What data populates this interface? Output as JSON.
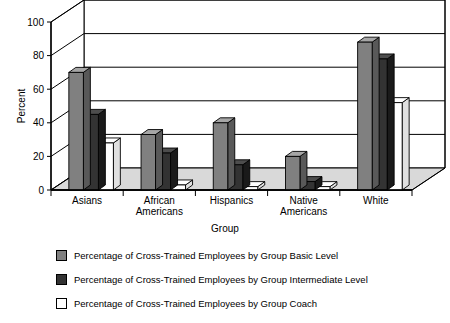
{
  "chart_data": {
    "type": "bar",
    "title": "",
    "xlabel": "Group",
    "ylabel": "Percent",
    "ylim": [
      0,
      100
    ],
    "yticks": [
      0,
      20,
      40,
      60,
      80,
      100
    ],
    "ytick_labels": [
      "0",
      "20",
      "40",
      "60",
      "80",
      "100"
    ],
    "grid": true,
    "grid_axis": "y",
    "legend_position": "below",
    "three_d": true,
    "categories": [
      "Asians",
      "African Americans",
      "Hispanics",
      "Native Americans",
      "White"
    ],
    "category_lines": [
      [
        "Asians"
      ],
      [
        "African",
        "Americans"
      ],
      [
        "Hispanics"
      ],
      [
        "Native",
        "Americans"
      ],
      [
        "White"
      ]
    ],
    "series": [
      {
        "name": "Percentage of Cross-Trained Employees by Group Basic Level",
        "color": "#808080",
        "values": [
          70,
          33,
          40,
          20,
          88
        ]
      },
      {
        "name": "Percentage of Cross-Trained Employees by Group Intermediate Level",
        "color": "#333333",
        "values": [
          45,
          22,
          15,
          5,
          78
        ]
      },
      {
        "name": "Percentage of Cross-Trained Employees by Group Coach",
        "color": "#ffffff",
        "values": [
          28,
          3,
          2,
          2,
          52
        ]
      }
    ]
  },
  "legend": {
    "items": [
      {
        "label": "Percentage of Cross-Trained Employees by Group Basic Level",
        "swatch_name": "legend-swatch-basic",
        "color": "#808080"
      },
      {
        "label": "Percentage of Cross-Trained Employees by Group Intermediate Level",
        "swatch_name": "legend-swatch-intermediate",
        "color": "#333333"
      },
      {
        "label": "Percentage of Cross-Trained Employees by Group Coach",
        "swatch_name": "legend-swatch-coach",
        "color": "#ffffff"
      }
    ]
  },
  "colors": {
    "basic_front": "#808080",
    "basic_top": "#a6a6a6",
    "basic_side": "#595959",
    "intermediate_front": "#333333",
    "intermediate_top": "#4d4d4d",
    "intermediate_side": "#1a1a1a",
    "coach_front": "#ffffff",
    "coach_top": "#ffffff",
    "coach_side": "#e0e0e0",
    "floor": "#d9d9d9",
    "wall": "#ffffff",
    "line": "#000000"
  }
}
